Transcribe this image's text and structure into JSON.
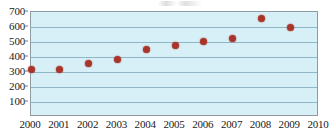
{
  "chart_data": {
    "type": "scatter",
    "title": "",
    "subtitle": "",
    "xlabel": "",
    "ylabel": "",
    "x": [
      2000,
      2001,
      2002,
      2003,
      2004,
      2005,
      2006,
      2007,
      2008,
      2009
    ],
    "values": [
      320,
      315,
      360,
      385,
      450,
      480,
      505,
      525,
      655,
      600
    ],
    "series": [
      {
        "name": "",
        "values": [
          320,
          315,
          360,
          385,
          450,
          480,
          505,
          525,
          655,
          600
        ]
      }
    ],
    "xlim": [
      2000,
      2010
    ],
    "ylim": [
      0,
      700
    ],
    "x_tick_labels": [
      "2000",
      "2001",
      "2002",
      "2003",
      "2004",
      "2005",
      "2006",
      "2007",
      "2008",
      "2009",
      "2010"
    ],
    "x_ticks": [
      2000,
      2001,
      2002,
      2003,
      2004,
      2005,
      2006,
      2007,
      2008,
      2009,
      2010
    ],
    "y_tick_labels": [
      "700",
      "600",
      "500",
      "400",
      "300",
      "200",
      "100"
    ],
    "y_ticks": [
      700,
      600,
      500,
      400,
      300,
      200,
      100
    ],
    "grid": true,
    "grid_axis": "y",
    "legend": false,
    "legend_position": "none",
    "marker": "circle",
    "marker_color": "#a8342a",
    "plot_background": "#d7eff6",
    "gridline_color": "#8fb6c4",
    "border_color": "#8e9ba1",
    "text_color": "#1a1a1a"
  }
}
